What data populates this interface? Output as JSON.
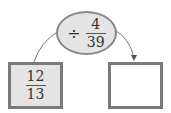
{
  "operation": {
    "symbol": "÷",
    "numerator": "4",
    "denominator": "39"
  },
  "input_box": {
    "numerator": "12",
    "denominator": "13"
  },
  "output_box": {
    "value": ""
  }
}
